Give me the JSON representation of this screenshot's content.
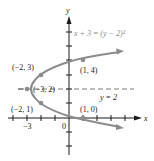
{
  "figure": {
    "equation_label": "x + 3 = (y − 2)²",
    "axis_line_label": "y = 2",
    "x_axis_label": "x",
    "y_axis_label": "y",
    "tick_labels": {
      "x_minus3": "−3",
      "origin": "0"
    },
    "points": [
      {
        "label": "(−2, 3)",
        "x": -2,
        "y": 3
      },
      {
        "label": "(1, 4)",
        "x": 1,
        "y": 4
      },
      {
        "label": "(−3, 2)",
        "x": -3,
        "y": 2
      },
      {
        "label": "(−2, 1)",
        "x": -2,
        "y": 1
      },
      {
        "label": "(1, 0)",
        "x": 1,
        "y": 0
      }
    ],
    "colors": {
      "curve": "#8c8c8c",
      "axes": "#1a1a1a",
      "dashed": "#555555"
    }
  }
}
